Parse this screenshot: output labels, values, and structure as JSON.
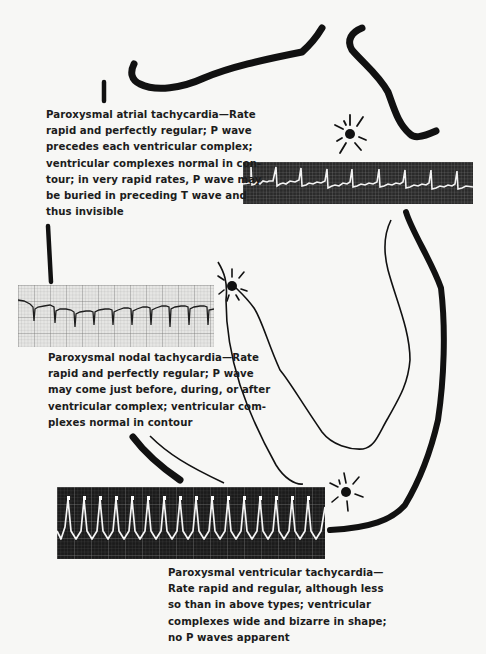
{
  "figure": {
    "panels": [
      {
        "id": "atrial",
        "caption_lines": [
          "Paroxysmal atrial tachycardia—Rate",
          "rapid and perfectly regular; P wave",
          "precedes each ventricular complex;",
          "ventricular complexes normal in con-",
          "tour; in very rapid rates, P wave may",
          "be buried in preceding T wave and",
          "thus invisible"
        ],
        "ecg_strip": {
          "background": "#2a2a2a",
          "trace": "#f2f2f2",
          "beats": 10,
          "style": "inverted-dark"
        },
        "focus": "atrial pacemaker (sunburst)"
      },
      {
        "id": "nodal",
        "caption_lines": [
          "Paroxysmal nodal tachycardia—Rate",
          "rapid and perfectly regular; P wave",
          "may come just before, during, or after",
          "ventricular complex; ventricular com-",
          "plexes normal in contour"
        ],
        "ecg_strip": {
          "background": "#dcdcdc",
          "trace": "#1e1e1e",
          "beats": 11,
          "style": "light-grid"
        },
        "focus": "AV node (sunburst)"
      },
      {
        "id": "ventricular",
        "caption_lines": [
          "Paroxysmal ventricular tachycardia—",
          "Rate rapid and regular, although less",
          "so than in above types; ventricular",
          "complexes wide and bizarre in shape;",
          "no P waves apparent"
        ],
        "ecg_strip": {
          "background": "#1b1b1b",
          "trace": "#f5f5f5",
          "beats": 17,
          "style": "inverted-dark"
        },
        "focus": "ventricular ectopic focus (sunburst)"
      }
    ],
    "colors": {
      "ink": "#111111",
      "paper": "#f7f7f5",
      "caption": "#1c1c1c"
    }
  }
}
